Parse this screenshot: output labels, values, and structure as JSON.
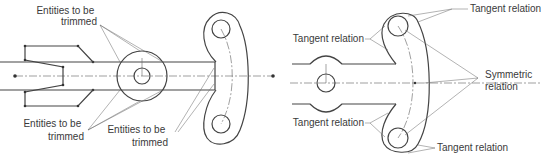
{
  "figure": {
    "left_panel": {
      "labels": [
        {
          "id": "trim-top",
          "line1": "Entities to be",
          "line2": "trimmed"
        },
        {
          "id": "trim-bottom-left",
          "line1": "Entities to be",
          "line2": "trimmed"
        },
        {
          "id": "trim-bottom-center",
          "line1": "Entities to be",
          "line2": "trimmed"
        }
      ]
    },
    "right_panel": {
      "labels": [
        {
          "id": "tangent-top-right",
          "text": "Tangent relation"
        },
        {
          "id": "tangent-upper-left",
          "text": "Tangent relation"
        },
        {
          "id": "symmetric",
          "line1": "Symmetric",
          "line2": "relation"
        },
        {
          "id": "tangent-lower-left",
          "text": "Tangent relation"
        },
        {
          "id": "tangent-bottom-right",
          "text": "Tangent relation"
        }
      ]
    }
  }
}
